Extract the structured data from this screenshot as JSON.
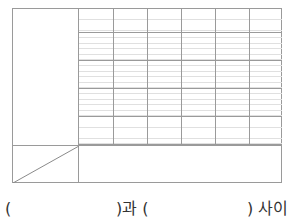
{
  "table": {
    "columns": 6,
    "major_rows": 5,
    "minor_lines_per_row": 5,
    "line_color": "#9a9a9a",
    "minor_line_color": "#e0e0e0",
    "header_cell_diagonal": true,
    "bottom_row_merged": true
  },
  "answer": {
    "open1": "(",
    "mid": ")과 (",
    "end": ") 사이"
  }
}
